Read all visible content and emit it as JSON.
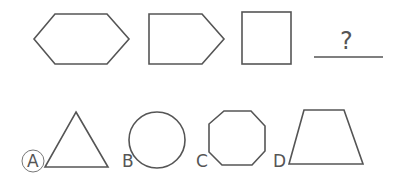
{
  "sequence": {
    "shapes": [
      "hexagon",
      "pentagon",
      "square"
    ],
    "blank": "?"
  },
  "options": [
    {
      "letter": "A",
      "shape": "triangle",
      "selected": true
    },
    {
      "letter": "B",
      "shape": "circle",
      "selected": false
    },
    {
      "letter": "C",
      "shape": "octagon",
      "selected": false
    },
    {
      "letter": "D",
      "shape": "trapezoid",
      "selected": false
    }
  ],
  "colors": {
    "stroke": "#555555",
    "background": "#ffffff"
  }
}
